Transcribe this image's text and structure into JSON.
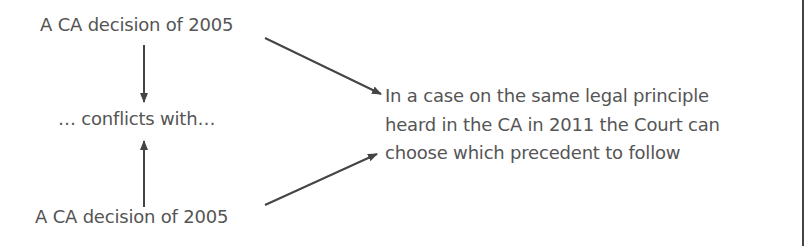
{
  "diagram": {
    "nodes": {
      "top": "A CA decision of 2005",
      "middle": "… conflicts with…",
      "bottom": "A CA decision of 2005",
      "result_lines": [
        "In a case on the same legal principle",
        "heard in the CA in 2011 the Court can",
        "choose which precedent to follow"
      ]
    },
    "edges": [
      {
        "from": "top",
        "to": "middle",
        "direction": "down"
      },
      {
        "from": "bottom",
        "to": "middle",
        "direction": "up"
      },
      {
        "from": "top",
        "to": "result",
        "direction": "diagonal-down-right"
      },
      {
        "from": "bottom",
        "to": "result",
        "direction": "diagonal-up-right"
      }
    ],
    "colors": {
      "text": "#555555",
      "arrow": "#444444",
      "border": "#444444"
    }
  }
}
